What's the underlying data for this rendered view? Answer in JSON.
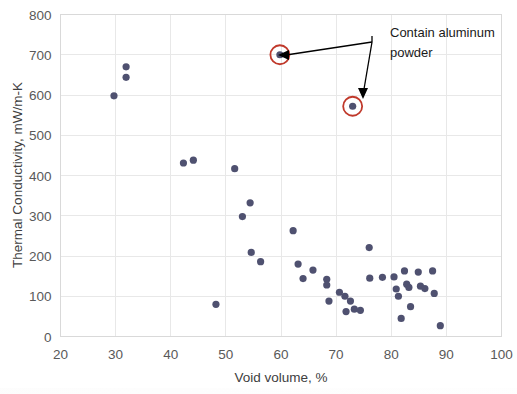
{
  "chart_data": {
    "type": "scatter",
    "title": "",
    "xlabel": "Void volume, %",
    "ylabel": "Thermal Conductivity, mW/m-K",
    "xlim": [
      20,
      100
    ],
    "ylim": [
      0,
      800
    ],
    "xticks": [
      20,
      30,
      40,
      50,
      60,
      70,
      80,
      90,
      100
    ],
    "yticks": [
      0,
      100,
      200,
      300,
      400,
      500,
      600,
      700,
      800
    ],
    "grid": "horizontal-and-vertical",
    "legend": "none",
    "marker_color": "#4f5170",
    "highlight_color": "#c0392b",
    "annotations": [
      {
        "text": "Contain aluminum powder",
        "text_line1": "Contain aluminum",
        "text_line2": "powder",
        "points": [
          {
            "x": 59.8,
            "y": 700
          },
          {
            "x": 73.0,
            "y": 572
          }
        ]
      }
    ],
    "series": [
      {
        "name": "Aerogel samples",
        "points": [
          {
            "x": 29.7,
            "y": 598
          },
          {
            "x": 31.9,
            "y": 670
          },
          {
            "x": 31.9,
            "y": 644
          },
          {
            "x": 42.3,
            "y": 431
          },
          {
            "x": 44.1,
            "y": 438
          },
          {
            "x": 48.2,
            "y": 80
          },
          {
            "x": 51.6,
            "y": 417
          },
          {
            "x": 53.0,
            "y": 298
          },
          {
            "x": 54.4,
            "y": 332
          },
          {
            "x": 54.6,
            "y": 209
          },
          {
            "x": 56.3,
            "y": 186
          },
          {
            "x": 59.8,
            "y": 700
          },
          {
            "x": 62.2,
            "y": 263
          },
          {
            "x": 63.1,
            "y": 180
          },
          {
            "x": 64.0,
            "y": 144
          },
          {
            "x": 65.8,
            "y": 165
          },
          {
            "x": 68.3,
            "y": 142
          },
          {
            "x": 68.3,
            "y": 128
          },
          {
            "x": 68.7,
            "y": 88
          },
          {
            "x": 70.6,
            "y": 110
          },
          {
            "x": 71.6,
            "y": 100
          },
          {
            "x": 71.8,
            "y": 62
          },
          {
            "x": 72.6,
            "y": 88
          },
          {
            "x": 73.0,
            "y": 572
          },
          {
            "x": 73.3,
            "y": 68
          },
          {
            "x": 74.4,
            "y": 65
          },
          {
            "x": 76.0,
            "y": 221
          },
          {
            "x": 76.1,
            "y": 145
          },
          {
            "x": 78.4,
            "y": 147
          },
          {
            "x": 80.5,
            "y": 148
          },
          {
            "x": 80.9,
            "y": 118
          },
          {
            "x": 81.3,
            "y": 100
          },
          {
            "x": 81.8,
            "y": 45
          },
          {
            "x": 82.4,
            "y": 163
          },
          {
            "x": 82.8,
            "y": 130
          },
          {
            "x": 83.2,
            "y": 122
          },
          {
            "x": 83.5,
            "y": 74
          },
          {
            "x": 84.9,
            "y": 160
          },
          {
            "x": 85.3,
            "y": 125
          },
          {
            "x": 86.1,
            "y": 119
          },
          {
            "x": 87.5,
            "y": 163
          },
          {
            "x": 87.8,
            "y": 107
          },
          {
            "x": 88.9,
            "y": 27
          }
        ]
      }
    ]
  }
}
